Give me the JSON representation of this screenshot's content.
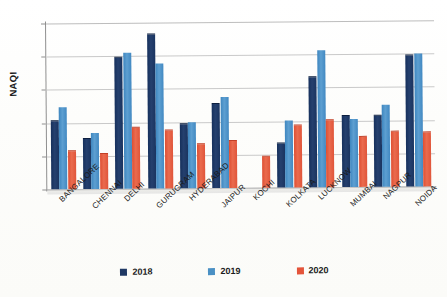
{
  "chart_data": {
    "type": "bar",
    "title": "",
    "xlabel": "",
    "ylabel": "NAQI",
    "ylim": [
      0,
      250
    ],
    "yticks": [
      0,
      50,
      100,
      150,
      200,
      250
    ],
    "grid": true,
    "legend_position": "bottom",
    "categories": [
      "BANGALORE",
      "CHENNAI",
      "DELHI",
      "GURUGRAM",
      "HYDERABAD",
      "JAIPUR",
      "KOCHI",
      "KOLKATA",
      "LUCKNOW",
      "MUMBAI",
      "NAGPUR",
      "NOIDA"
    ],
    "series": [
      {
        "name": "2018",
        "color": "#1F3864",
        "values": [
          102,
          75,
          197,
          232,
          96,
          126,
          null,
          66,
          166,
          107,
          107,
          197
        ]
      },
      {
        "name": "2019",
        "color": "#4A90C4",
        "values": [
          123,
          84,
          205,
          188,
          100,
          137,
          null,
          101,
          207,
          102,
          124,
          201
        ]
      },
      {
        "name": "2020",
        "color": "#E4543A",
        "values": [
          58,
          53,
          92,
          87,
          67,
          71,
          46,
          93,
          101,
          76,
          83,
          82
        ]
      }
    ]
  },
  "legend": [
    {
      "label": "2018",
      "color": "#1F3864"
    },
    {
      "label": "2019",
      "color": "#4A90C4"
    },
    {
      "label": "2020",
      "color": "#E4543A"
    }
  ],
  "axis": {
    "y_title": "NAQI",
    "y_tick_labels": [
      "0",
      "50",
      "100",
      "150",
      "200",
      "250"
    ]
  }
}
